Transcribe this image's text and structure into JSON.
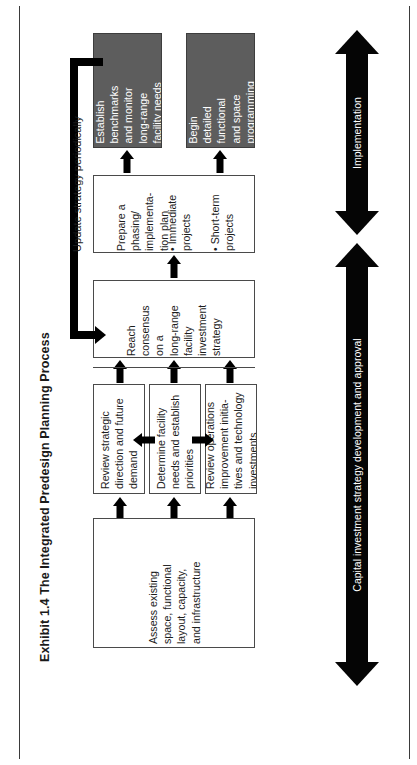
{
  "exhibit": {
    "title": "Exhibit 1.4 The Integrated Predesign Planning Process"
  },
  "colors": {
    "shaded_box_fill": "#5d5d5d",
    "shaded_box_text": "#ffffff",
    "plain_box_fill": "#ffffff",
    "box_border": "#4a4a4a",
    "arrow": "#000000",
    "page_border": "#3a3a3a",
    "text": "#1c1c1c"
  },
  "diagram": {
    "orientation": "rotated-90-ccw",
    "nodes": [
      {
        "id": "assess-existing",
        "label": "Assess existing\nspace, functional\nlayout, capacity,\nand infrastructure",
        "style": "plain",
        "stage": "inputs"
      },
      {
        "id": "review-strategic-direction",
        "label": "Review strategic\ndirection and future\ndemand",
        "style": "plain",
        "stage": "analysis"
      },
      {
        "id": "determine-facility-needs",
        "label": "Determine facility\nneeds and establish\npriorities",
        "style": "plain",
        "stage": "analysis"
      },
      {
        "id": "review-operations-improvement",
        "label": "Review operations\nimprovement initia-\ntives and technology\ninvestments",
        "style": "plain",
        "stage": "analysis"
      },
      {
        "id": "reach-consensus",
        "label": "Reach\nconsensus\non a\nlong-range\nfacility\ninvestment\nstrategy",
        "style": "plain",
        "stage": "strategy"
      },
      {
        "id": "prepare-phasing-plan",
        "label": "Prepare a\nphasing/\nimplementa-\ntion plan",
        "sub_items": "• Immediate\n   projects\n\n• Short-term\n   projects",
        "style": "plain",
        "stage": "planning"
      },
      {
        "id": "establish-benchmarks",
        "label": "Establish\nbenchmarks\nand monitor\nlong-range\nfacility needs",
        "style": "shaded",
        "stage": "implementation"
      },
      {
        "id": "begin-detailed-programming",
        "label": "Begin\ndetailed\nfunctional\nand space\nprogramming",
        "style": "shaded",
        "stage": "implementation"
      }
    ],
    "feedback": {
      "id": "update-strategy",
      "label": "Update strategy periodically",
      "from": "establish-benchmarks",
      "to": "reach-consensus"
    },
    "phases": [
      {
        "id": "implementation",
        "label": "Implementation",
        "direction": "double"
      },
      {
        "id": "capital-investment-strategy",
        "label": "Capital investment strategy development and approval",
        "direction": "double"
      }
    ]
  }
}
